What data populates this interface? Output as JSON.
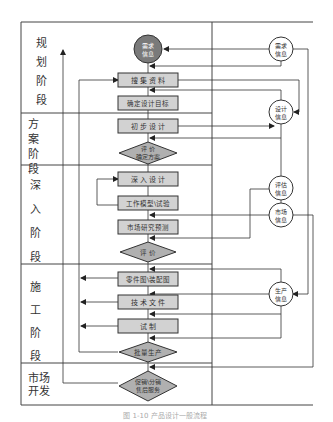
{
  "stages": [
    {
      "id": "planning",
      "label": "规\n划\n阶\n段"
    },
    {
      "id": "scheme",
      "label": "方\n案\n阶\n段"
    },
    {
      "id": "deep",
      "label": "深\n入\n阶\n段"
    },
    {
      "id": "construction",
      "label": "施\n工\n阶\n段"
    },
    {
      "id": "market",
      "label": "市场\n开发"
    }
  ],
  "stage_labels": {
    "planning": [
      "规",
      "划",
      "阶",
      "段"
    ],
    "scheme": [
      "方",
      "案",
      "阶",
      "段"
    ],
    "deep": [
      "深",
      "入",
      "阶",
      "段"
    ],
    "construction": [
      "施",
      "工",
      "阶",
      "段"
    ],
    "market": [
      "市场",
      "开发"
    ]
  },
  "process_nodes": {
    "demand_info_main": {
      "type": "circle-filled",
      "lines": [
        "需求",
        "信息"
      ]
    },
    "collect_data": {
      "type": "box",
      "label": "搜 集 资 料"
    },
    "define_target": {
      "type": "box",
      "label": "确定设计目标"
    },
    "initial_design": {
      "type": "box",
      "label": "初 步 设 计"
    },
    "evaluate_scheme": {
      "type": "diamond",
      "lines": [
        "评 价",
        "确定方案"
      ]
    },
    "deep_design": {
      "type": "box",
      "label": "深 入 设 计"
    },
    "work_model": {
      "type": "box",
      "label": "工作模型\\试验"
    },
    "market_forecast": {
      "type": "box",
      "label": "市场研究预测"
    },
    "evaluate": {
      "type": "diamond",
      "lines": [
        "评 价"
      ]
    },
    "parts_drawing": {
      "type": "box",
      "label": "零件图\\装配图"
    },
    "tech_docs": {
      "type": "box",
      "label": "技 术 文 件"
    },
    "trial": {
      "type": "box",
      "label": "试    制"
    },
    "mass_production": {
      "type": "diamond",
      "lines": [
        "批量生产"
      ]
    },
    "sales_service": {
      "type": "diamond",
      "lines": [
        "促销\\分销",
        "售后服务"
      ]
    }
  },
  "info_nodes": {
    "demand_info": {
      "lines": [
        "需求",
        "信息"
      ]
    },
    "design_info": {
      "lines": [
        "设计",
        "信息"
      ]
    },
    "eval_info": {
      "lines": [
        "评估",
        "信息"
      ]
    },
    "market_info": {
      "lines": [
        "市场",
        "信息"
      ]
    },
    "production_info": {
      "lines": [
        "生产",
        "信息"
      ]
    }
  },
  "caption": "图 1-10  产品设计一般流程",
  "colors": {
    "box_fill": "#d2d2d2",
    "circle_fill": "#7a7a7a",
    "line": "#333333",
    "frame": "#444444"
  }
}
